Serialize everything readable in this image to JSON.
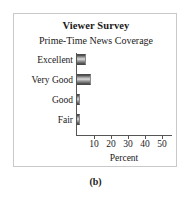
{
  "figure": {
    "caption": "(b)"
  },
  "chart_data": {
    "type": "bar",
    "orientation": "horizontal",
    "title": "Viewer Survey",
    "subtitle": "Prime-Time News Coverage",
    "categories": [
      "Excellent",
      "Very Good",
      "Good",
      "Fair"
    ],
    "values": [
      30,
      50,
      10,
      10
    ],
    "xlabel": "Percent",
    "ylabel": "",
    "xlim": [
      0,
      55
    ],
    "xticks": [
      10,
      20,
      30,
      40,
      50
    ],
    "xtick_labels": [
      "10",
      "20",
      "30",
      "40",
      "50"
    ],
    "grid": false,
    "legend": false,
    "bar_color": "#9a9a9a",
    "axis_color": "#555555",
    "frame_color": "#c9c9c9"
  }
}
